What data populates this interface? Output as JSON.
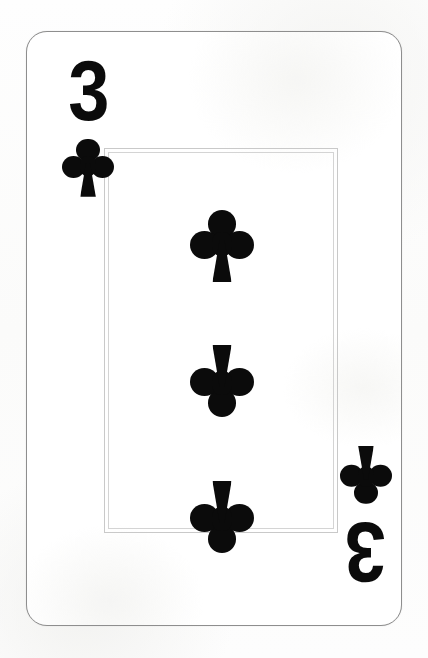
{
  "card": {
    "name": "Three of Clubs",
    "rank": "3",
    "suit_name": "clubs",
    "suit_symbol": "club-icon",
    "suit_color": "#0b0b0b",
    "card_face_color": "#ffffff",
    "card_border_color": "#8e8e8e",
    "inner_frame_color": "#c9c9c9",
    "background_color": "#fdfdfc",
    "pip_count": 3
  },
  "corners": {
    "top_left": {
      "rank": "3",
      "suit": "club-icon",
      "orientation": "upright"
    },
    "bottom_right": {
      "rank": "3",
      "suit": "club-icon",
      "orientation": "rotated-180"
    }
  },
  "center_pips": [
    {
      "index": 1,
      "suit": "club-icon",
      "orientation": "upright"
    },
    {
      "index": 2,
      "suit": "club-icon",
      "orientation": "inverted"
    },
    {
      "index": 3,
      "suit": "club-icon",
      "orientation": "inverted"
    }
  ]
}
